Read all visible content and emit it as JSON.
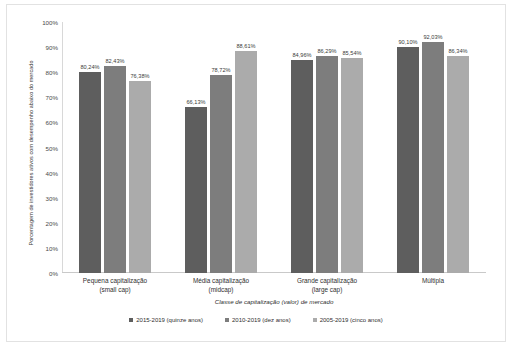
{
  "chart_data": {
    "type": "bar",
    "title": "",
    "subtitle": "",
    "xlabel": "Classe de capitalização (valor) de mercado",
    "ylabel": "Porcentagem de investidores ativos com desempenho abaixo do mercado",
    "categories": [
      "Pequena capitalização\n(small cap)",
      "Média capitalização\n(midcap)",
      "Grande capitalização\n(large cap)",
      "Múltipla"
    ],
    "categories_lines": [
      [
        "Pequena capitalização",
        "(small cap)"
      ],
      [
        "Média capitalização",
        "(midcap)"
      ],
      [
        "Grande capitalização",
        "(large cap)"
      ],
      [
        "Múltipla",
        ""
      ]
    ],
    "series": [
      {
        "name": "2015-2019 (quinze anos)",
        "color": "#5e5e5e",
        "values": [
          80.24,
          82.43,
          84.96,
          90.1
        ],
        "labels": [
          "80,24%",
          "82,43%",
          "84,96%",
          "90,10%"
        ]
      },
      {
        "name": "2010-2019 (dez anos)",
        "color": "#7d7d7d",
        "values": [
          82.43,
          78.72,
          86.29,
          92.03
        ],
        "labels": [
          "82,43%",
          "78,72%",
          "86,29%",
          "92,03%"
        ]
      },
      {
        "name": "2005-2019 (cinco anos)",
        "color": "#ababab",
        "values": [
          76.38,
          88.61,
          85.54,
          86.34
        ],
        "labels": [
          "76,38%",
          "88,61%",
          "85,54%",
          "86,34%"
        ]
      }
    ],
    "group_values": [
      [
        80.24,
        82.43,
        76.38
      ],
      [
        66.13,
        78.72,
        88.61
      ],
      [
        84.96,
        86.29,
        85.54
      ],
      [
        90.1,
        92.03,
        86.34
      ]
    ],
    "group_labels": [
      [
        "80,24%",
        "82,43%",
        "76,38%"
      ],
      [
        "66,13%",
        "78,72%",
        "88,61%"
      ],
      [
        "84,96%",
        "86,29%",
        "85,54%"
      ],
      [
        "90,10%",
        "92,03%",
        "86,34%"
      ]
    ],
    "ylim": [
      0,
      100
    ],
    "yticks": [
      0,
      10,
      20,
      30,
      40,
      50,
      60,
      70,
      80,
      90,
      100
    ],
    "ytick_labels": [
      "0%",
      "10%",
      "20%",
      "30%",
      "40%",
      "50%",
      "60%",
      "70%",
      "80%",
      "90%",
      "100%"
    ],
    "grid": false,
    "legend_position": "bottom",
    "value_labels_shown": true
  },
  "axes": {
    "y_title": "Porcentagem de investidores ativos com desempenho abaixo do mercado",
    "x_title": "Classe de capitalização (valor) de mercado"
  },
  "legend": {
    "items": [
      {
        "label": "2015-2019 (quinze anos)",
        "color": "#5e5e5e"
      },
      {
        "label": "2010-2019 (dez anos)",
        "color": "#7d7d7d"
      },
      {
        "label": "2005-2019 (cinco anos)",
        "color": "#ababab"
      }
    ]
  },
  "colors": {
    "series_1": "#5e5e5e",
    "series_2": "#7d7d7d",
    "series_3": "#ababab",
    "axis": "#c9c9c9",
    "text": "#3b3b3b",
    "background": "#ffffff"
  }
}
